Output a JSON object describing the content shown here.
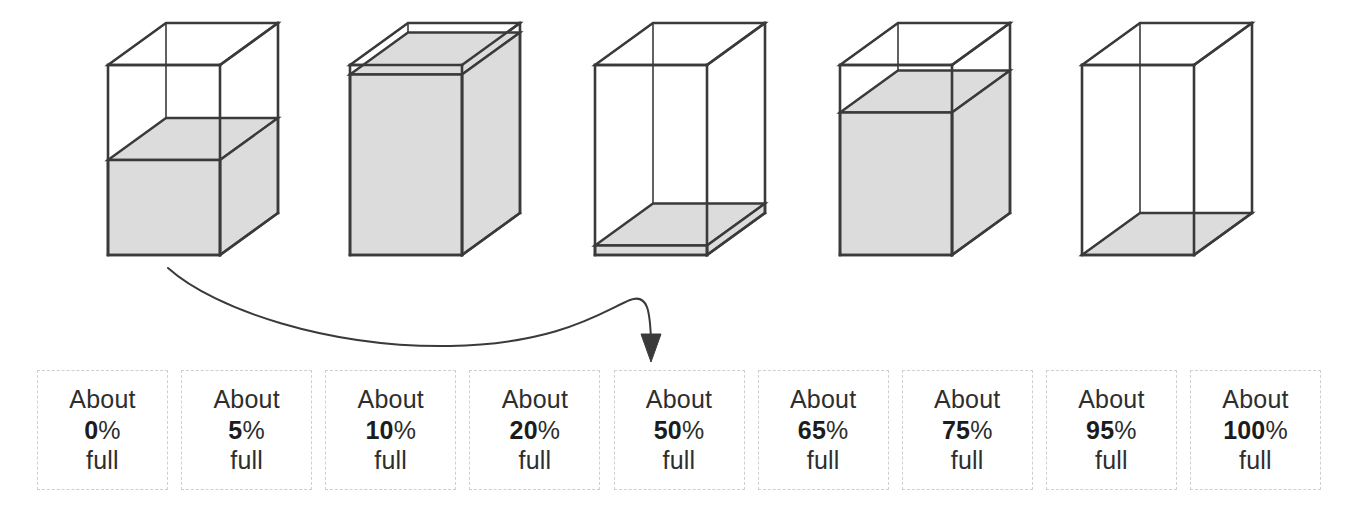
{
  "illustration": {
    "title": "Estimating how full a container is",
    "stroke_color": "#3a3a3a",
    "fill_color": "#dcdcdc",
    "background_color": "#ffffff",
    "boxes": [
      {
        "name": "box-1",
        "fill_percent": 50,
        "label": "about half full"
      },
      {
        "name": "box-2",
        "fill_percent": 95,
        "label": "nearly completely full"
      },
      {
        "name": "box-3",
        "fill_percent": 5,
        "label": "a thin layer at the bottom"
      },
      {
        "name": "box-4",
        "fill_percent": 75,
        "label": "three quarters full"
      },
      {
        "name": "box-5",
        "fill_percent": 0,
        "label": "empty"
      }
    ],
    "arrow": {
      "name": "pointer-arrow",
      "from_box": "box-1",
      "to_card_index": 4,
      "description": "curved arrow from the first container to the About 50% full card"
    }
  },
  "cards": {
    "prefix": "About",
    "suffix": "full",
    "percent_symbol": "%",
    "items": [
      {
        "percent": "0"
      },
      {
        "percent": "5"
      },
      {
        "percent": "10"
      },
      {
        "percent": "20"
      },
      {
        "percent": "50"
      },
      {
        "percent": "65"
      },
      {
        "percent": "75"
      },
      {
        "percent": "95"
      },
      {
        "percent": "100"
      }
    ]
  },
  "chart_data": {
    "type": "bar",
    "xlabel": "",
    "ylabel": "Percent full",
    "ylim": [
      0,
      100
    ],
    "categories": [
      "box-1",
      "box-2",
      "box-3",
      "box-4",
      "box-5"
    ],
    "values": [
      50,
      95,
      5,
      75,
      0
    ],
    "annotations": [
      "About 0% full",
      "About 5% full",
      "About 10% full",
      "About 20% full",
      "About 50% full",
      "About 65% full",
      "About 75% full",
      "About 95% full",
      "About 100% full"
    ]
  }
}
